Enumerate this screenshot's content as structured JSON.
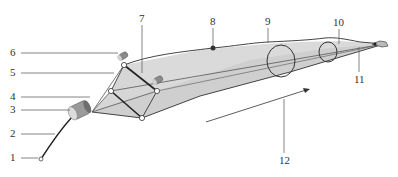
{
  "diagram": {
    "type": "technical-illustration",
    "colors": {
      "net_fill": "#d9d9d9",
      "net_fill_light": "#e9e9e9",
      "line_dark": "#222222",
      "line_mid": "#555555",
      "leader": "#666666",
      "float": "#8a8a8a"
    },
    "callouts": [
      {
        "id": "1",
        "label": "1"
      },
      {
        "id": "2",
        "label": "2"
      },
      {
        "id": "3",
        "label": "3"
      },
      {
        "id": "4",
        "label": "4"
      },
      {
        "id": "5",
        "label": "5"
      },
      {
        "id": "6",
        "label": "6"
      },
      {
        "id": "7",
        "label": "7"
      },
      {
        "id": "8",
        "label": "8"
      },
      {
        "id": "9",
        "label": "9"
      },
      {
        "id": "10",
        "label": "10"
      },
      {
        "id": "11",
        "label": "11"
      },
      {
        "id": "12",
        "label": "12"
      }
    ]
  }
}
